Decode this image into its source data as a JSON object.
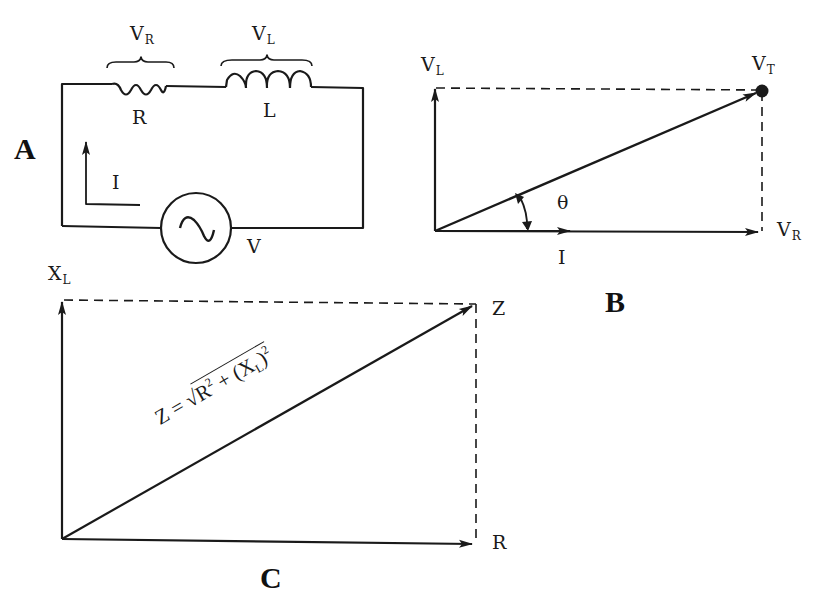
{
  "panels": {
    "A": {
      "label": "A",
      "title": "Series RL circuit",
      "components": {
        "resistor": {
          "label": "R",
          "voltage_label": "V",
          "voltage_sub": "R"
        },
        "inductor": {
          "label": "L",
          "voltage_label": "V",
          "voltage_sub": "L"
        },
        "source": {
          "label": "V",
          "symbol": "ac-source-icon"
        },
        "current": {
          "label": "I"
        }
      }
    },
    "B": {
      "label": "B",
      "title": "Voltage phasor diagram",
      "vectors": {
        "inductor_voltage": {
          "label": "V",
          "sub": "L"
        },
        "resistor_voltage": {
          "label": "V",
          "sub": "R"
        },
        "total_voltage": {
          "label": "V",
          "sub": "T"
        },
        "current": {
          "label": "I"
        }
      },
      "angle_label": "θ"
    },
    "C": {
      "label": "C",
      "title": "Impedance triangle",
      "vectors": {
        "reactance": {
          "label": "X",
          "sub": "L"
        },
        "resistance": {
          "label": "R"
        },
        "impedance": {
          "label": "Z"
        }
      },
      "formula": {
        "lhs": "Z = ",
        "radical": "√",
        "term1": "R",
        "term1_exp": "2",
        "plus": " + (X",
        "term2_sub": "L",
        "close": ")",
        "term2_exp": "2"
      }
    }
  },
  "colors": {
    "ink": "#1a1a1a",
    "background": "#ffffff"
  }
}
